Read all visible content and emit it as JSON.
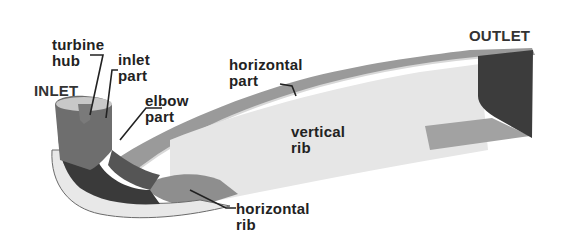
{
  "diagram": {
    "type": "3D draft tube geometry with labeled parts",
    "labels": {
      "inlet": "INLET",
      "outlet": "OUTLET",
      "turbine_hub": [
        "turbine",
        "hub"
      ],
      "inlet_part": [
        "inlet",
        "part"
      ],
      "elbow_part": [
        "elbow",
        "part"
      ],
      "horizontal_part": [
        "horizontal",
        "part"
      ],
      "vertical_rib": [
        "vertical",
        "rib"
      ],
      "horizontal_rib": [
        "horizontal",
        "rib"
      ]
    },
    "colors": {
      "background": "#ffffff",
      "dark_surface": "#3a3a3a",
      "mid_surface": "#8a8a8a",
      "light_surface": "#e4e4e4",
      "top_surface": "#9a9a9a",
      "text": "#222222"
    }
  }
}
